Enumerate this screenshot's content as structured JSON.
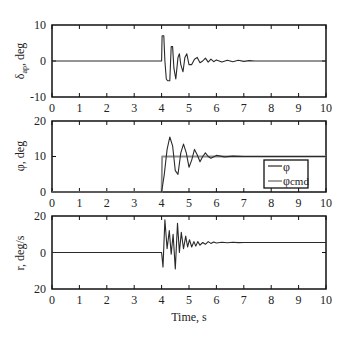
{
  "chart_data": [
    {
      "type": "line",
      "title": "",
      "xlabel": "",
      "ylabel": "δ_a, deg",
      "ylabel_main": "δ",
      "ylabel_sub": "ap",
      "ylabel_rest": ", deg",
      "xlim": [
        0,
        10
      ],
      "ylim": [
        -10,
        10
      ],
      "xticks": [
        "0",
        "1",
        "2",
        "3",
        "4",
        "5",
        "6",
        "7",
        "8",
        "9",
        "10"
      ],
      "yticks": [
        "10",
        "0",
        "-10"
      ],
      "grid": false,
      "series": [
        {
          "name": "aileron deflection",
          "x": [
            0,
            4.0,
            4.02,
            4.08,
            4.12,
            4.17,
            4.22,
            4.3,
            4.35,
            4.4,
            4.45,
            4.52,
            4.6,
            4.65,
            4.7,
            4.78,
            4.85,
            4.92,
            5.0,
            5.1,
            5.2,
            5.3,
            5.4,
            5.5,
            5.6,
            5.7,
            5.8,
            5.9,
            6.0,
            6.2,
            6.4,
            6.6,
            6.8,
            7.0,
            7.2,
            7.4,
            8,
            10
          ],
          "y": [
            0,
            0,
            7,
            7,
            0,
            -5,
            -5.5,
            -5.5,
            4,
            4,
            -2,
            -5,
            1,
            2,
            -1,
            -3,
            1,
            2,
            -1,
            -1,
            0.5,
            1,
            -0.5,
            0,
            0.8,
            -0.3,
            0.5,
            -0.2,
            0.3,
            -0.3,
            0.2,
            -0.2,
            0.2,
            -0.1,
            0.1,
            0,
            0,
            0
          ]
        }
      ]
    },
    {
      "type": "line",
      "title": "",
      "xlabel": "",
      "ylabel": "φ, deg",
      "xlim": [
        0,
        10
      ],
      "ylim": [
        0,
        20
      ],
      "xticks": [
        "0",
        "1",
        "2",
        "3",
        "4",
        "5",
        "6",
        "7",
        "8",
        "9",
        "10"
      ],
      "yticks": [
        "20",
        "10",
        "0"
      ],
      "grid": false,
      "legend": {
        "position": "lower right",
        "entries": [
          "φ",
          "φcmd"
        ]
      },
      "series": [
        {
          "name": "φ",
          "x": [
            0,
            4.0,
            4.1,
            4.2,
            4.3,
            4.4,
            4.5,
            4.6,
            4.7,
            4.8,
            4.9,
            5.0,
            5.1,
            5.2,
            5.3,
            5.4,
            5.5,
            5.6,
            5.7,
            5.8,
            6.0,
            6.3,
            6.6,
            7.0,
            8,
            10
          ],
          "y": [
            0,
            0,
            5,
            12,
            15.5,
            13,
            6,
            5,
            11,
            13.5,
            11,
            7,
            9,
            12,
            10.5,
            8.5,
            10,
            11,
            10,
            9.5,
            10.3,
            9.9,
            10.1,
            10,
            10,
            10
          ]
        },
        {
          "name": "φcmd",
          "x": [
            0,
            4.0,
            4.02,
            10
          ],
          "y": [
            0,
            0,
            10,
            10
          ]
        }
      ]
    },
    {
      "type": "line",
      "title": "",
      "xlabel": "Time, s",
      "ylabel": "r, deg/s",
      "xlim": [
        0,
        10
      ],
      "ylim": [
        -20,
        20
      ],
      "xticks": [
        "0",
        "1",
        "2",
        "3",
        "4",
        "5",
        "6",
        "7",
        "8",
        "9",
        "10"
      ],
      "yticks": [
        "20",
        "0",
        "20"
      ],
      "grid": false,
      "series": [
        {
          "name": "yaw rate",
          "x": [
            0,
            4.0,
            4.05,
            4.12,
            4.2,
            4.28,
            4.35,
            4.42,
            4.5,
            4.58,
            4.65,
            4.72,
            4.8,
            4.88,
            4.95,
            5.02,
            5.1,
            5.18,
            5.25,
            5.32,
            5.4,
            5.5,
            5.6,
            5.7,
            5.8,
            5.9,
            6.0,
            6.2,
            6.4,
            6.6,
            6.8,
            7.0,
            8,
            10
          ],
          "y": [
            0,
            0,
            -8,
            18,
            2,
            12,
            -1,
            10,
            -9,
            16,
            0,
            11,
            2,
            9,
            3,
            7,
            3,
            6,
            3.5,
            6,
            4,
            5.5,
            4.5,
            6,
            5,
            5.8,
            5.2,
            5.6,
            5.3,
            5.6,
            5.4,
            5.5,
            5.5,
            5.5
          ]
        }
      ]
    }
  ],
  "panels": [
    {
      "ylabel_main": "δ",
      "ylabel_sub": "ap",
      "ylabel_rest": ", deg",
      "ytick_top": "10",
      "ytick_mid": "0",
      "ytick_bot": "-10"
    },
    {
      "ylabel_main": "φ, deg",
      "ytick_top": "20",
      "ytick_mid": "10",
      "ytick_bot": "0"
    },
    {
      "ylabel_main": "r, deg/s",
      "ytick_top": "20",
      "ytick_mid": "0",
      "ytick_bot": "20"
    }
  ],
  "xticks": [
    "0",
    "1",
    "2",
    "3",
    "4",
    "5",
    "6",
    "7",
    "8",
    "9",
    "10"
  ],
  "xlabel": "Time, s",
  "legend": {
    "entry1": "φ",
    "entry2": "φ",
    "entry2_sub": "cmd"
  },
  "colors": {
    "line": "#2a2a2a",
    "cmd": "#8c8c8c",
    "axis": "#111111"
  }
}
